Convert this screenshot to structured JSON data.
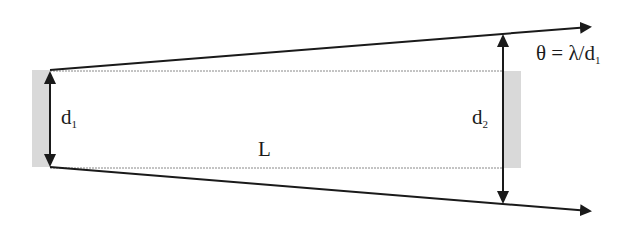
{
  "diagram": {
    "type": "beam-divergence",
    "labels": {
      "d1": "d",
      "d1_sub": "1",
      "d2": "d",
      "d2_sub": "2",
      "length": "L",
      "theta_formula": "θ = λ/d",
      "theta_sub": "1"
    },
    "colors": {
      "line": "#1a1a1a",
      "aperture_fill": "#d9d9d9",
      "dotted": "#888888"
    }
  }
}
